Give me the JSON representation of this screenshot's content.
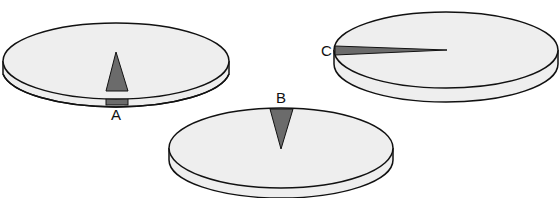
{
  "figure": {
    "type": "disc-sector-illustration",
    "colors": {
      "disc": "#eeeeee",
      "sector": "#6b6b6b",
      "outline": "#111111"
    },
    "discs": [
      {
        "label": "A",
        "sector_position": "front edge, pointing to center"
      },
      {
        "label": "B",
        "sector_position": "back edge, pointing to center"
      },
      {
        "label": "C",
        "sector_position": "left edge, thin sliver to center"
      }
    ]
  },
  "labels": {
    "a": "A",
    "b": "B",
    "c": "C"
  }
}
